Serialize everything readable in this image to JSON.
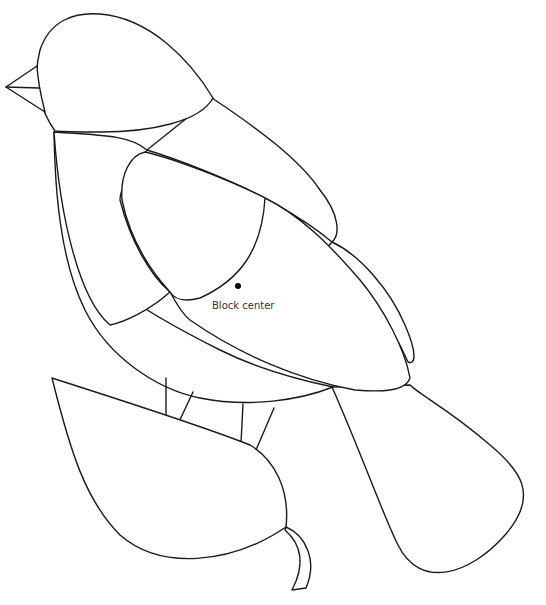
{
  "illustration": {
    "subject": "bird-on-leaf-pattern",
    "stroke_color": "#1a1a1a",
    "background": "#ffffff"
  },
  "marker": {
    "label": "Block center",
    "x": 238,
    "y": 286
  }
}
